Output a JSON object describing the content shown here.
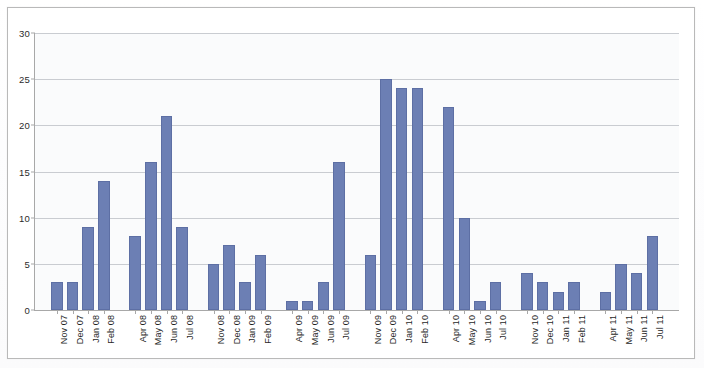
{
  "chart_data": {
    "type": "bar",
    "title": "",
    "subtitle": "",
    "xlabel": "",
    "ylabel": "",
    "ylim": [
      0,
      30
    ],
    "ytick_values": [
      0,
      5,
      10,
      15,
      20,
      25,
      30
    ],
    "ytick_labels": [
      "0",
      "5",
      "10",
      "15",
      "20",
      "25",
      "30"
    ],
    "grid": "horizontal",
    "legend": "none",
    "bar_color": "#6c7fb4",
    "plot_background": "#fafbfc",
    "axis_color": "#a8a8a8",
    "gridline_color": "#c9ccd1",
    "categories": [
      "Nov 07",
      "Dec 07",
      "Jan 08",
      "Feb 08",
      "Apr 08",
      "May 08",
      "Jun 08",
      "Jul 08",
      "Nov 08",
      "Dec 08",
      "Jan 09",
      "Feb 09",
      "Apr 09",
      "May 09",
      "Jun 09",
      "Jul 09",
      "Nov 09",
      "Dec 09",
      "Jan 10",
      "Feb 10",
      "Apr 10",
      "May 10",
      "Jun 10",
      "Jul 10",
      "Nov 10",
      "Dec 10",
      "Jan 11",
      "Feb 11",
      "Apr 11",
      "May 11",
      "Jun 11",
      "Jul 11"
    ],
    "values": [
      3,
      3,
      9,
      14,
      8,
      16,
      21,
      9,
      5,
      7,
      3,
      6,
      1,
      1,
      3,
      16,
      6,
      25,
      24,
      24,
      22,
      10,
      1,
      3,
      4,
      3,
      2,
      3,
      2,
      5,
      4,
      8
    ],
    "groups": [
      {
        "label": "2007-2008",
        "categories": [
          "Nov 07",
          "Dec 07",
          "Jan 08",
          "Feb 08",
          "Apr 08",
          "May 08",
          "Jun 08",
          "Jul 08"
        ],
        "values": [
          3,
          3,
          9,
          14,
          8,
          16,
          21,
          9
        ]
      },
      {
        "label": "2008-2009",
        "categories": [
          "Nov 08",
          "Dec 08",
          "Jan 09",
          "Feb 09",
          "Apr 09",
          "May 09",
          "Jun 09",
          "Jul 09"
        ],
        "values": [
          5,
          7,
          3,
          6,
          1,
          1,
          3,
          16
        ]
      },
      {
        "label": "2009-2010",
        "categories": [
          "Nov 09",
          "Dec 09",
          "Jan 10",
          "Feb 10",
          "Apr 10",
          "May 10",
          "Jun 10",
          "Jul 10"
        ],
        "values": [
          6,
          25,
          24,
          24,
          22,
          10,
          1,
          3
        ]
      },
      {
        "label": "2010-2011",
        "categories": [
          "Nov 10",
          "Dec 10",
          "Jan 11",
          "Feb 11",
          "Apr 11",
          "May 11",
          "Jun 11",
          "Jul 11"
        ],
        "values": [
          4,
          3,
          2,
          3,
          2,
          5,
          4,
          8
        ]
      }
    ],
    "slot_layout": {
      "note": "Each year-block has 8 month bars plus an internal empty slot between Feb and Apr, and an empty separator slot between blocks.",
      "bars_per_block": 8,
      "internal_gap_slots": 1,
      "between_block_gap_slots": 1
    }
  }
}
